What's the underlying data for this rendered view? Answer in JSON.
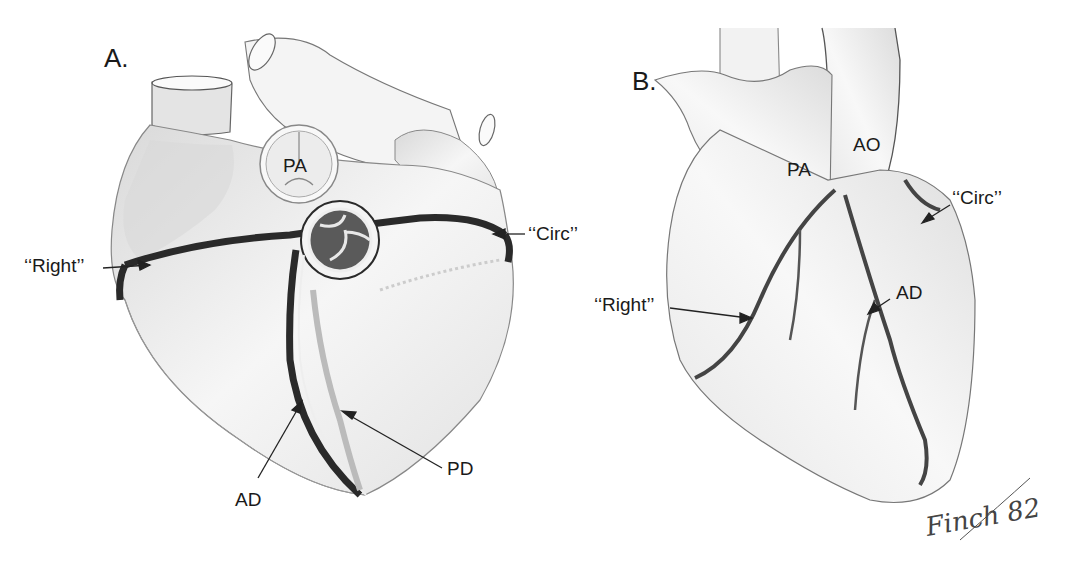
{
  "panels": {
    "a": {
      "label": "A.",
      "labels": {
        "pa": "PA",
        "right": "‘‘Right’’",
        "circ": "‘‘Circ’’",
        "ad": "AD",
        "pd": "PD"
      }
    },
    "b": {
      "label": "B.",
      "labels": {
        "pa": "PA",
        "ao": "AO",
        "circ": "‘‘Circ’’",
        "right": "‘‘Right’’",
        "ad": "AD"
      }
    }
  },
  "signature": "Finch 82"
}
